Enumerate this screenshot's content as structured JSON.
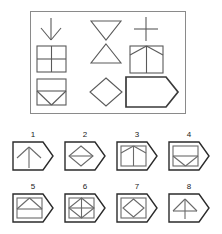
{
  "puzzle": {
    "kind": "raven-progressive-matrices",
    "title": "Matrix reasoning item",
    "stroke_color": "#5a5a5a",
    "bold_stroke_color": "#3a3a3a",
    "frame_color": "#8a8a8a",
    "background_color": "#ffffff",
    "option_border_color": "#2b2b2b"
  },
  "matrix": {
    "rows": 3,
    "columns": 3,
    "cells": [
      {
        "position": "r1c1",
        "figure": "arrow-down",
        "label": "downward arrow"
      },
      {
        "position": "r1c2",
        "figure": "triangle-down",
        "label": "downward triangle"
      },
      {
        "position": "r1c3",
        "figure": "plus-cross",
        "label": "plus cross"
      },
      {
        "position": "r2c1",
        "figure": "square-with-cross",
        "label": "square divided by cross"
      },
      {
        "position": "r2c2",
        "figure": "triangle-up",
        "label": "upward triangle"
      },
      {
        "position": "r2c3",
        "figure": "square-with-arrow-up",
        "label": "square with upward arrow"
      },
      {
        "position": "r3c1",
        "figure": "square-with-chevron-down",
        "label": "square with downward chevron"
      },
      {
        "position": "r3c2",
        "figure": "diamond",
        "label": "diamond"
      },
      {
        "position": "r3c3",
        "figure": "pentagon-blank",
        "label": "blank bold pentagon (missing piece)"
      }
    ]
  },
  "options": {
    "row_one": [
      {
        "number": "1",
        "figure": "pentagon-with-arrow-up",
        "label": "pentagon containing upward arrow"
      },
      {
        "number": "2",
        "figure": "pentagon-with-diamond-line",
        "label": "pentagon containing diamond with horizontal line"
      },
      {
        "number": "3",
        "figure": "pentagon-with-square-arrow-up",
        "label": "pentagon containing square with upward arrow"
      },
      {
        "number": "4",
        "figure": "pentagon-with-square-chevron-down",
        "label": "pentagon containing square with downward chevron"
      }
    ],
    "row_two": [
      {
        "number": "5",
        "figure": "pentagon-with-square-chevron-up",
        "label": "pentagon containing square with upward chevron"
      },
      {
        "number": "6",
        "figure": "pentagon-with-square-diamond-cross",
        "label": "pentagon containing square with diamond and cross"
      },
      {
        "number": "7",
        "figure": "pentagon-with-square-diamond",
        "label": "pentagon containing square with diamond"
      },
      {
        "number": "8",
        "figure": "pentagon-with-triangle-stem",
        "label": "pentagon containing triangle with vertical stem"
      }
    ]
  }
}
